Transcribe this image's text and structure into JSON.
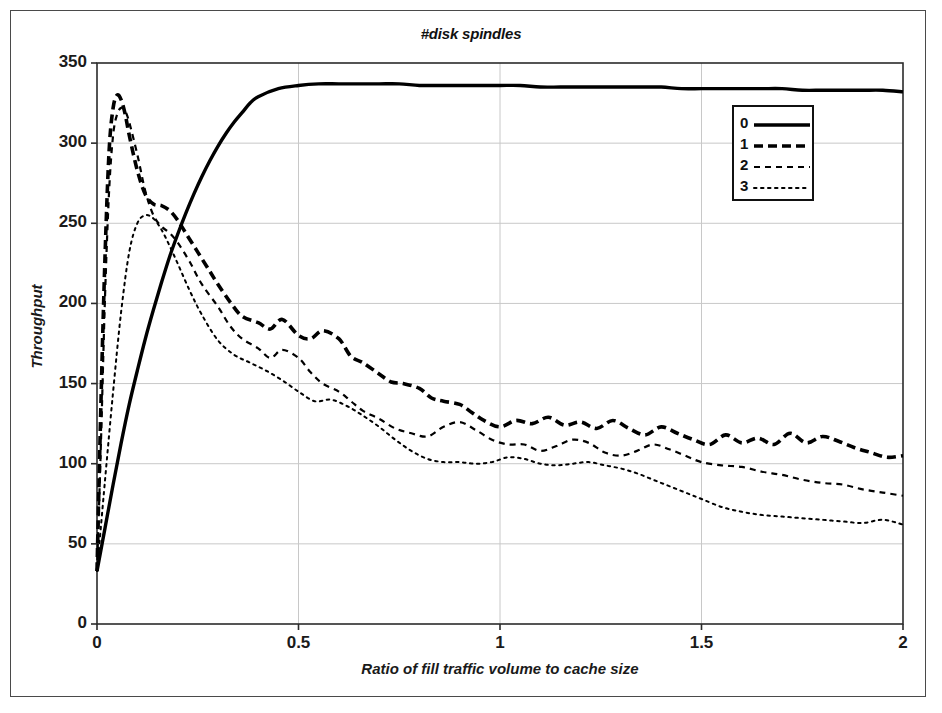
{
  "chart_data": {
    "type": "line",
    "title": "#disk spindles",
    "xlabel": "Ratio of fill traffic volume to cache size",
    "ylabel": "Throughput",
    "xlim": [
      0,
      2
    ],
    "ylim": [
      0,
      350
    ],
    "xticks": [
      "0",
      "0.5",
      "1",
      "1.5",
      "2"
    ],
    "xtick_values": [
      0,
      0.5,
      1,
      1.5,
      2
    ],
    "yticks": [
      "0",
      "50",
      "100",
      "150",
      "200",
      "250",
      "300",
      "350"
    ],
    "ytick_values": [
      0,
      50,
      100,
      150,
      200,
      250,
      300,
      350
    ],
    "grid": true,
    "grid_color": "#c8c8c8",
    "legend_position": "top-right",
    "legend_title": "",
    "line_color": "#000000",
    "series": [
      {
        "name": "0",
        "style": "solid",
        "width": 3.4,
        "dash": "none",
        "x": [
          0,
          0.02,
          0.04,
          0.06,
          0.08,
          0.1,
          0.12,
          0.14,
          0.16,
          0.18,
          0.2,
          0.22,
          0.24,
          0.26,
          0.28,
          0.3,
          0.32,
          0.34,
          0.36,
          0.38,
          0.4,
          0.45,
          0.5,
          0.55,
          0.6,
          0.65,
          0.7,
          0.75,
          0.8,
          0.85,
          0.9,
          0.95,
          1.0,
          1.05,
          1.1,
          1.15,
          1.2,
          1.25,
          1.3,
          1.35,
          1.4,
          1.45,
          1.5,
          1.55,
          1.6,
          1.65,
          1.7,
          1.75,
          1.8,
          1.85,
          1.9,
          1.95,
          2.0
        ],
        "y": [
          33,
          60,
          87,
          113,
          137,
          158,
          178,
          196,
          213,
          229,
          243,
          256,
          268,
          279,
          289,
          298,
          306,
          313,
          319,
          325,
          329,
          334,
          336,
          337,
          337,
          337,
          337,
          337,
          336,
          336,
          336,
          336,
          336,
          336,
          335,
          335,
          335,
          335,
          335,
          335,
          335,
          334,
          334,
          334,
          334,
          334,
          334,
          333,
          333,
          333,
          333,
          333,
          332
        ]
      },
      {
        "name": "1",
        "style": "dashed-thick",
        "width": 3.6,
        "dash": "9,5",
        "x": [
          0,
          0.01,
          0.02,
          0.03,
          0.04,
          0.05,
          0.06,
          0.07,
          0.08,
          0.1,
          0.12,
          0.14,
          0.16,
          0.18,
          0.2,
          0.22,
          0.25,
          0.28,
          0.3,
          0.33,
          0.36,
          0.4,
          0.43,
          0.46,
          0.5,
          0.53,
          0.56,
          0.6,
          0.63,
          0.66,
          0.7,
          0.73,
          0.76,
          0.8,
          0.83,
          0.86,
          0.9,
          0.93,
          0.96,
          1.0,
          1.04,
          1.08,
          1.12,
          1.16,
          1.2,
          1.24,
          1.28,
          1.32,
          1.36,
          1.4,
          1.44,
          1.48,
          1.52,
          1.56,
          1.6,
          1.64,
          1.68,
          1.72,
          1.76,
          1.8,
          1.84,
          1.88,
          1.92,
          1.96,
          2.0
        ],
        "y": [
          33,
          140,
          230,
          295,
          322,
          330,
          327,
          318,
          305,
          283,
          268,
          262,
          261,
          258,
          252,
          244,
          232,
          220,
          212,
          201,
          192,
          188,
          184,
          190,
          180,
          178,
          183,
          178,
          167,
          163,
          156,
          151,
          150,
          147,
          141,
          139,
          137,
          132,
          127,
          123,
          127,
          125,
          129,
          124,
          126,
          122,
          127,
          122,
          118,
          123,
          119,
          115,
          112,
          118,
          113,
          116,
          112,
          119,
          113,
          117,
          114,
          110,
          107,
          104,
          105
        ]
      },
      {
        "name": "2",
        "style": "dashed-thin",
        "width": 2.2,
        "dash": "6,5",
        "x": [
          0,
          0.01,
          0.02,
          0.03,
          0.04,
          0.05,
          0.06,
          0.07,
          0.08,
          0.1,
          0.12,
          0.14,
          0.16,
          0.18,
          0.2,
          0.23,
          0.26,
          0.3,
          0.33,
          0.36,
          0.4,
          0.43,
          0.46,
          0.5,
          0.53,
          0.56,
          0.6,
          0.63,
          0.66,
          0.7,
          0.74,
          0.78,
          0.82,
          0.86,
          0.9,
          0.94,
          0.98,
          1.02,
          1.06,
          1.1,
          1.14,
          1.18,
          1.22,
          1.26,
          1.3,
          1.34,
          1.38,
          1.42,
          1.46,
          1.5,
          1.55,
          1.6,
          1.65,
          1.7,
          1.75,
          1.8,
          1.85,
          1.9,
          1.95,
          2.0
        ],
        "y": [
          33,
          115,
          205,
          270,
          305,
          318,
          322,
          320,
          313,
          293,
          270,
          255,
          248,
          244,
          238,
          226,
          212,
          198,
          186,
          178,
          172,
          166,
          171,
          166,
          157,
          150,
          145,
          139,
          133,
          128,
          122,
          119,
          117,
          123,
          126,
          121,
          115,
          112,
          112,
          108,
          111,
          115,
          113,
          107,
          105,
          108,
          112,
          109,
          105,
          101,
          99,
          98,
          95,
          93,
          90,
          88,
          87,
          84,
          82,
          80
        ]
      },
      {
        "name": "3",
        "style": "dotted",
        "width": 2.0,
        "dash": "2.5,4.5",
        "x": [
          0,
          0.02,
          0.04,
          0.06,
          0.08,
          0.1,
          0.12,
          0.14,
          0.16,
          0.18,
          0.2,
          0.23,
          0.26,
          0.3,
          0.34,
          0.38,
          0.42,
          0.46,
          0.5,
          0.54,
          0.58,
          0.62,
          0.66,
          0.7,
          0.74,
          0.78,
          0.82,
          0.86,
          0.9,
          0.94,
          0.98,
          1.02,
          1.06,
          1.1,
          1.14,
          1.18,
          1.22,
          1.26,
          1.3,
          1.34,
          1.38,
          1.42,
          1.46,
          1.5,
          1.55,
          1.6,
          1.65,
          1.7,
          1.75,
          1.8,
          1.85,
          1.9,
          1.95,
          2.0
        ],
        "y": [
          33,
          90,
          145,
          195,
          232,
          250,
          255,
          253,
          246,
          236,
          225,
          208,
          193,
          177,
          168,
          163,
          158,
          152,
          145,
          139,
          140,
          136,
          130,
          123,
          115,
          108,
          103,
          101,
          101,
          100,
          101,
          104,
          103,
          100,
          99,
          100,
          101,
          99,
          97,
          94,
          90,
          86,
          82,
          78,
          73,
          70,
          68,
          67,
          66,
          65,
          64,
          63,
          65,
          62
        ]
      }
    ]
  },
  "axes": {
    "x_tick_labels": [
      "0",
      "0.5",
      "1",
      "1.5",
      "2"
    ],
    "y_tick_labels": [
      "0",
      "50",
      "100",
      "150",
      "200",
      "250",
      "300",
      "350"
    ]
  },
  "legend": {
    "items": [
      {
        "label": "0"
      },
      {
        "label": "1"
      },
      {
        "label": "2"
      },
      {
        "label": "3"
      }
    ]
  }
}
